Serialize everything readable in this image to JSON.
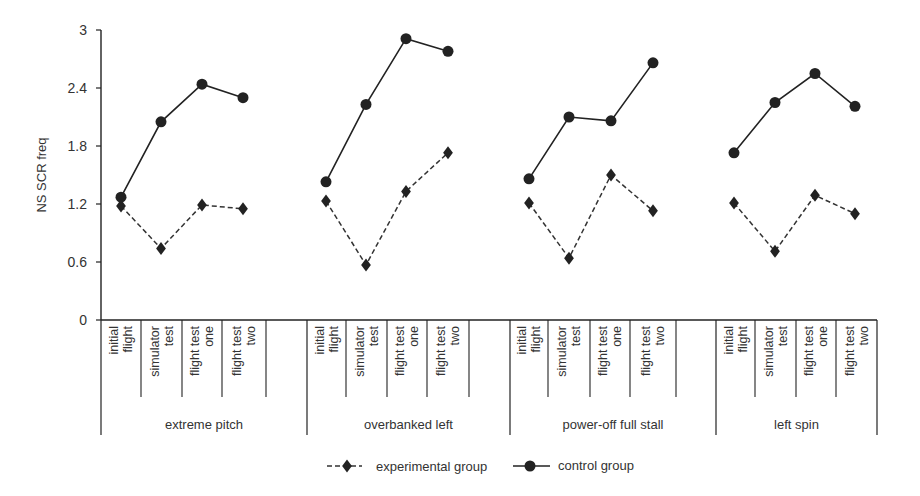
{
  "chart_data": {
    "type": "line",
    "title": "",
    "xlabel": "",
    "ylabel": "NS SCR freq",
    "ylim": [
      0,
      3
    ],
    "yticks": [
      "0",
      "0.6",
      "1.2",
      "1.8",
      "2.4",
      "3"
    ],
    "grid": false,
    "legend_position": "bottom",
    "groups": [
      {
        "name": "extreme pitch",
        "categories": [
          "initial flight",
          "simulator test",
          "flight test one",
          "flight test two"
        ],
        "experimental": [
          1.18,
          0.74,
          1.19,
          1.15
        ],
        "control": [
          1.27,
          2.05,
          2.44,
          2.3
        ]
      },
      {
        "name": "overbanked left",
        "categories": [
          "initial flight",
          "simulator test",
          "flight test one",
          "flight test two"
        ],
        "experimental": [
          1.23,
          0.57,
          1.33,
          1.73
        ],
        "control": [
          1.43,
          2.23,
          2.91,
          2.78
        ]
      },
      {
        "name": "power-off full stall",
        "categories": [
          "initial flight",
          "simulator test",
          "flight test one",
          "flight test two"
        ],
        "experimental": [
          1.21,
          0.64,
          1.5,
          1.13
        ],
        "control": [
          1.46,
          2.1,
          2.06,
          2.66
        ]
      },
      {
        "name": "left spin",
        "categories": [
          "initial flight",
          "simulator test",
          "flight test one",
          "flight test two"
        ],
        "experimental": [
          1.21,
          0.71,
          1.29,
          1.1
        ],
        "control": [
          1.73,
          2.25,
          2.55,
          2.21
        ]
      }
    ],
    "series": [
      {
        "name": "experimental group",
        "marker": "diamond",
        "line": "dashed",
        "color": "#222222"
      },
      {
        "name": "control group",
        "marker": "circle",
        "line": "solid",
        "color": "#222222"
      }
    ]
  }
}
